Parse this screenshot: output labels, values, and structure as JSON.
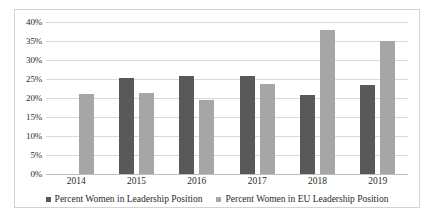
{
  "chart_data": {
    "type": "bar",
    "title": "",
    "xlabel": "",
    "ylabel": "",
    "ylim": [
      0,
      40
    ],
    "ytick_step": 5,
    "grid": true,
    "legend_position": "bottom",
    "categories": [
      "2014",
      "2015",
      "2016",
      "2017",
      "2018",
      "2019"
    ],
    "ytick_labels": [
      "40%",
      "35%",
      "30%",
      "25%",
      "20%",
      "15%",
      "10%",
      "5%",
      "0%"
    ],
    "series": [
      {
        "name": "Percent Women in Leadership Position",
        "color": "#595959",
        "values": [
          null,
          25.3,
          25.7,
          25.8,
          20.8,
          23.3
        ]
      },
      {
        "name": "Percent Women in EU Leadership Position",
        "color": "#a6a6a6",
        "values": [
          21.0,
          21.4,
          19.5,
          23.7,
          38.0,
          35.0
        ]
      }
    ]
  },
  "colors": {
    "series_dark": "#595959",
    "series_light": "#a6a6a6",
    "gridline": "#d9d9d9",
    "border": "#d3d3d3",
    "text": "#2b2b2b"
  }
}
